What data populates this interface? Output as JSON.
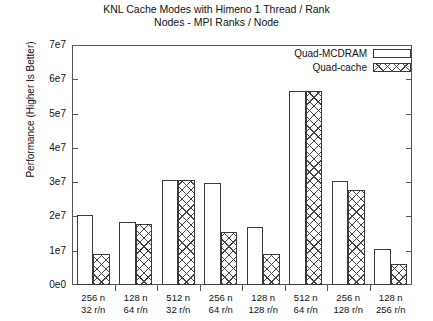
{
  "chart_data": {
    "type": "bar",
    "title": "KNL Cache Modes with Himeno 1 Thread / Rank",
    "subtitle": "Nodes - MPI Ranks / Node",
    "xlabel": "",
    "ylabel": "Performance (Higher Is Better)",
    "ylim": [
      0,
      70000000
    ],
    "ytick_labels": [
      "0e0",
      "1e7",
      "2e7",
      "3e7",
      "4e7",
      "5e7",
      "6e7",
      "7e7"
    ],
    "ytick_values": [
      0,
      10000000,
      20000000,
      30000000,
      40000000,
      50000000,
      60000000,
      70000000
    ],
    "grid": false,
    "legend_position": "top-right",
    "categories": [
      "256 n\n32 r/n",
      "128 n\n64 r/n",
      "512 n\n32 r/n",
      "256 n\n64 r/n",
      "128 n\n128 r/n",
      "512 n\n64 r/n",
      "256 n\n128 r/n",
      "128 n\n256 r/n"
    ],
    "category_lines": [
      {
        "top": "256 n",
        "bottom": "32 r/n"
      },
      {
        "top": "128 n",
        "bottom": "64 r/n"
      },
      {
        "top": "512 n",
        "bottom": "32 r/n"
      },
      {
        "top": "256 n",
        "bottom": "64 r/n"
      },
      {
        "top": "128 n",
        "bottom": "128 r/n"
      },
      {
        "top": "512 n",
        "bottom": "64 r/n"
      },
      {
        "top": "256 n",
        "bottom": "128 r/n"
      },
      {
        "top": "128 n",
        "bottom": "256 r/n"
      }
    ],
    "series": [
      {
        "name": "Quad-MCDRAM",
        "fill": "hollow",
        "values": [
          20500000,
          18300000,
          30500000,
          29700000,
          17000000,
          56500000,
          30200000,
          10500000
        ]
      },
      {
        "name": "Quad-cache",
        "fill": "x-hatch",
        "values": [
          9000000,
          17800000,
          30500000,
          15500000,
          9000000,
          56500000,
          27600000,
          6200000
        ]
      }
    ]
  },
  "legend": {
    "items": [
      {
        "label": "Quad-MCDRAM",
        "style": "hollow"
      },
      {
        "label": "Quad-cache",
        "style": "x-hatch"
      }
    ]
  }
}
